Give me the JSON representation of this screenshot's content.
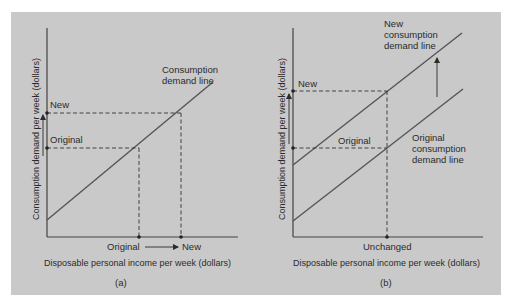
{
  "colors": {
    "background": "#c9c9c9",
    "ink": "#2b2b2b",
    "line": "#555555"
  },
  "panel_a": {
    "caption": "(a)",
    "y_axis_title": "Consumption demand per week (dollars)",
    "x_axis_title": "Disposable personal income  per week (dollars)",
    "line_label_1": "Consumption",
    "line_label_2": "demand line",
    "y_new_label": "New",
    "y_original_label": "Original",
    "x_original_label": "Original",
    "x_new_label": "New"
  },
  "panel_b": {
    "caption": "(b)",
    "y_axis_title": "Consumption demand per week (dollars)",
    "x_axis_title": "Disposable personal income per week (dollars)",
    "new_line_label_1": "New",
    "new_line_label_2": "consumption",
    "new_line_label_3": "demand line",
    "orig_line_label_1": "Original",
    "orig_line_label_2": "consumption",
    "orig_line_label_3": "demand line",
    "y_new_label": "New",
    "y_original_label": "Original",
    "x_unchanged_label": "Unchanged"
  }
}
